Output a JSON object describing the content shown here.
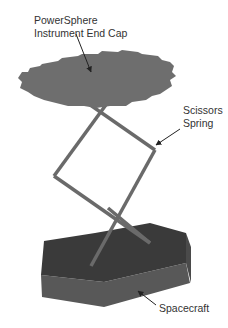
{
  "diagram": {
    "labels": {
      "end_cap_line1": "PowerSphere",
      "end_cap_line2": "Instrument End Cap",
      "spring_line1": "Scissors",
      "spring_line2": "Spring",
      "spacecraft": "Spacecraft"
    },
    "colors": {
      "end_cap": "#6e6e6e",
      "spring": "#6a6a6a",
      "spacecraft_top": "#3a3a3a",
      "spacecraft_side": "#585858",
      "spacecraft_side_right": "#4a4a4a",
      "arrow": "#222222",
      "text": "#333333"
    }
  }
}
